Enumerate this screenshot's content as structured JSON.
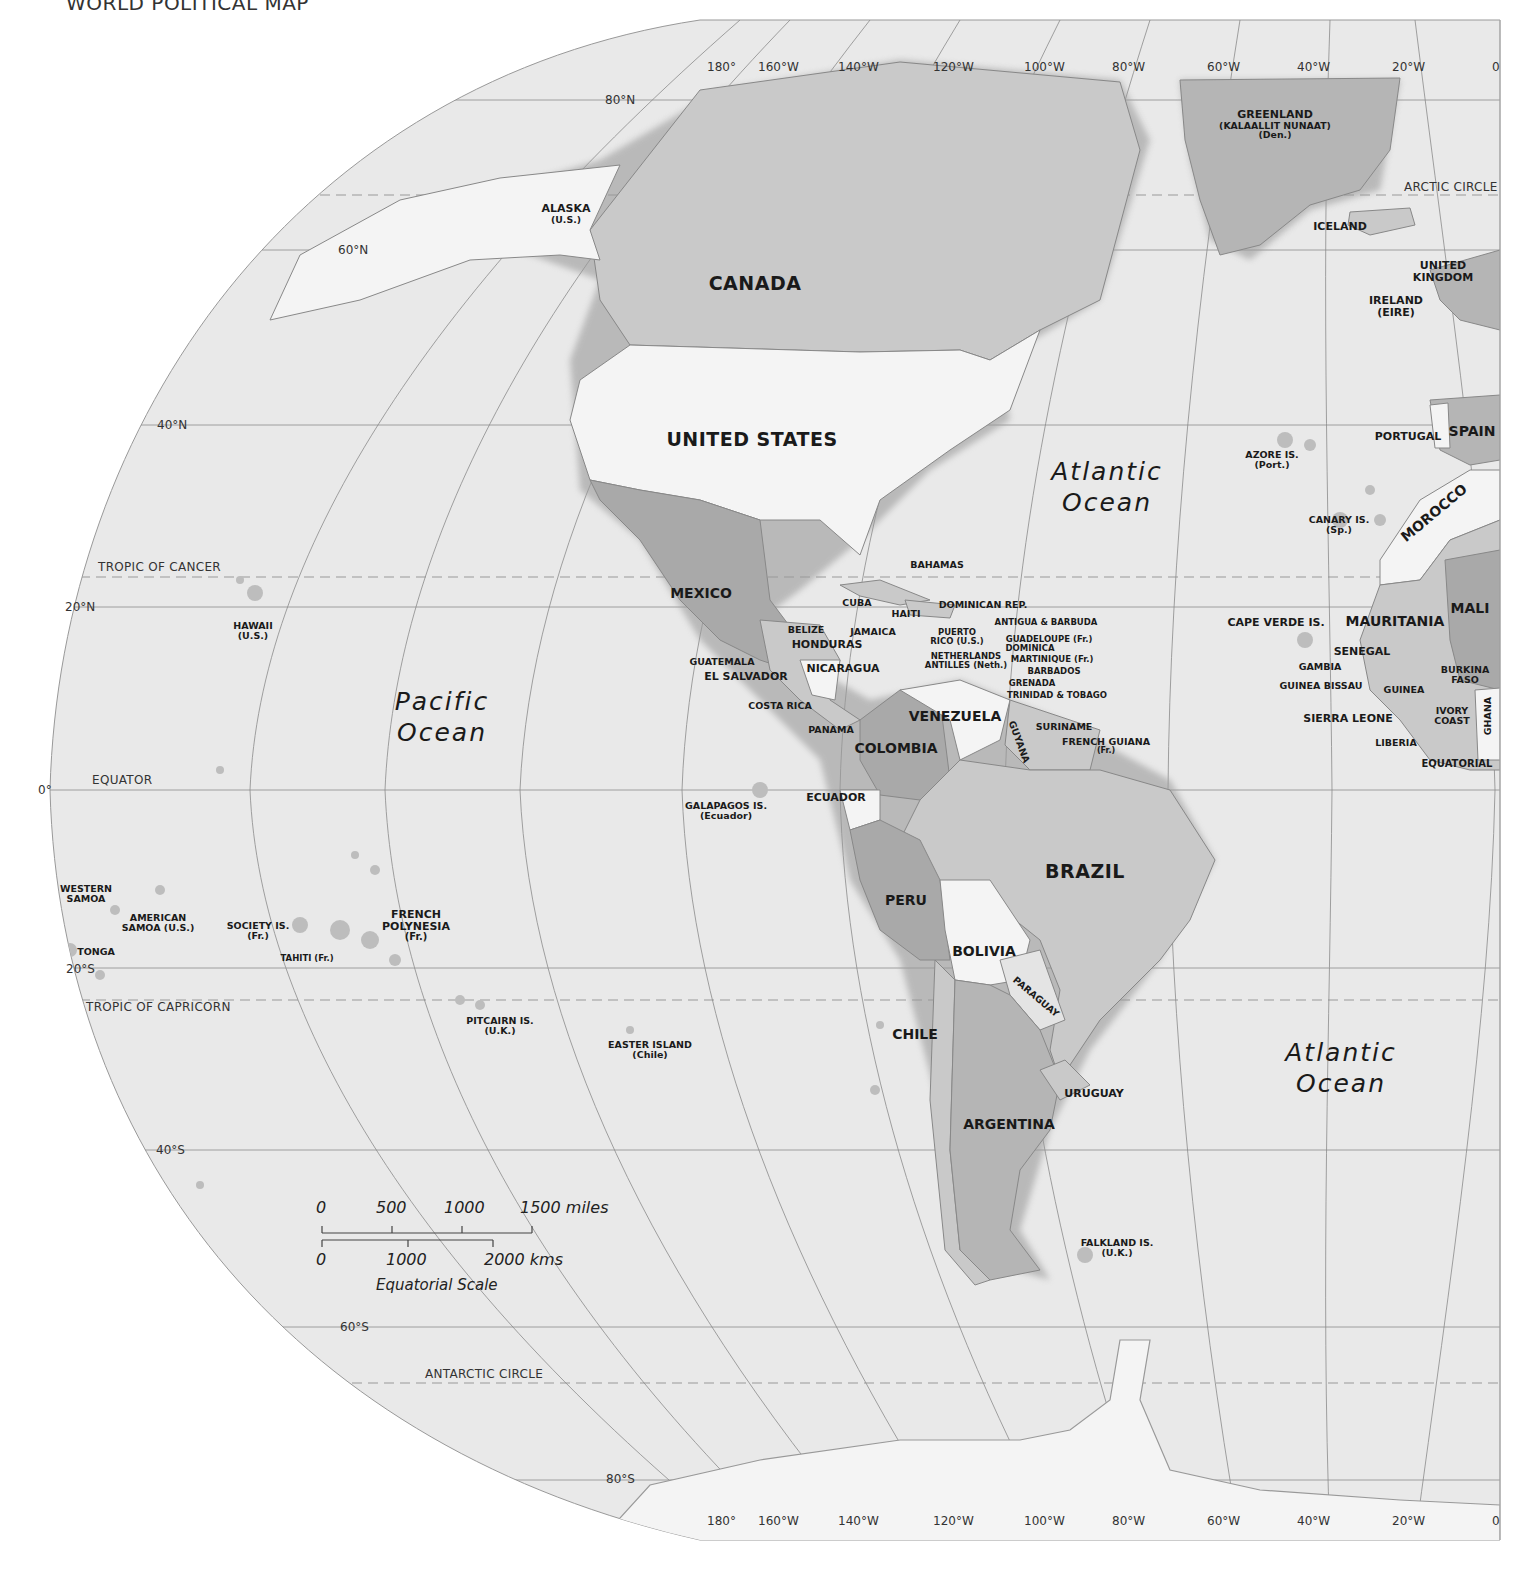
{
  "title": "WORLD POLITICAL MAP",
  "colors": {
    "ocean": "#e9e9e9",
    "land_light": "#f4f4f4",
    "land_mid": "#c9c9c9",
    "land_dark": "#a9a9a9",
    "coast_shadow": "#9a9a9a",
    "grid": "#8a8a8a",
    "text": "#1a1a1a"
  },
  "longitude_labels_top": [
    "180°",
    "160°W",
    "140°W",
    "120°W",
    "100°W",
    "80°W",
    "60°W",
    "40°W",
    "20°W",
    "0"
  ],
  "longitude_labels_bottom": [
    "180°",
    "160°W",
    "140°W",
    "120°W",
    "100°W",
    "80°W",
    "60°W",
    "40°W",
    "20°W",
    "0"
  ],
  "latitude_labels": {
    "n80": "80°N",
    "n60": "60°N",
    "n40": "40°N",
    "n20": "20°N",
    "eq": "0°",
    "s20": "20°S",
    "s40": "40°S",
    "s60": "60°S",
    "s80": "80°S"
  },
  "special_lines": {
    "arctic": "ARCTIC CIRCLE",
    "cancer": "TROPIC OF CANCER",
    "equator": "EQUATOR",
    "capricorn": "TROPIC OF CAPRICORN",
    "antarctic": "ANTARCTIC CIRCLE",
    "equatorial_africa": "EQUATORIAL"
  },
  "oceans": {
    "pacific": {
      "line1": "Pacific",
      "line2": "Ocean"
    },
    "atlantic_north": {
      "line1": "Atlantic",
      "line2": "Ocean"
    },
    "atlantic_south": {
      "line1": "Atlantic",
      "line2": "Ocean"
    }
  },
  "countries": {
    "canada": "CANADA",
    "united_states": "UNITED STATES",
    "alaska": {
      "name": "ALASKA",
      "note": "(U.S.)"
    },
    "greenland": {
      "name": "GREENLAND",
      "alt": "(KALAALLIT NUNAAT)",
      "note": "(Den.)"
    },
    "iceland": "ICELAND",
    "uk": {
      "line1": "UNITED",
      "line2": "KINGDOM"
    },
    "ireland": {
      "name": "IRELAND",
      "note": "(EIRE)"
    },
    "portugal": "PORTUGAL",
    "spain": "SPAIN",
    "morocco": "MOROCCO",
    "mauritania": "MAURITANIA",
    "mali": "MALI",
    "senegal": "SENEGAL",
    "gambia": "GAMBIA",
    "guinea_bissau": "GUINEA BISSAU",
    "guinea": "GUINEA",
    "burkina_faso": {
      "line1": "BURKINA",
      "line2": "FASO"
    },
    "ivory_coast": {
      "line1": "IVORY",
      "line2": "COAST"
    },
    "ghana": "GHANA",
    "sierra_leone": "SIERRA LEONE",
    "liberia": "LIBERIA",
    "mexico": "MEXICO",
    "cuba": "CUBA",
    "bahamas": "BAHAMAS",
    "haiti": "HAITI",
    "dominican_rep": "DOMINICAN REP.",
    "jamaica": "JAMAICA",
    "belize": "BELIZE",
    "honduras": "HONDURAS",
    "guatemala": "GUATEMALA",
    "el_salvador": "EL SALVADOR",
    "nicaragua": "NICARAGUA",
    "costa_rica": "COSTA RICA",
    "panama": "PANAMA",
    "puerto_rico": {
      "line1": "PUERTO",
      "line2": "RICO (U.S.)"
    },
    "antigua": "ANTIGUA & BARBUDA",
    "guadeloupe": "GUADELOUPE (Fr.)",
    "dominica": "DOMINICA",
    "martinique": "MARTINIQUE (Fr.)",
    "barbados": "BARBADOS",
    "netherlands_antilles": {
      "line1": "NETHERLANDS",
      "line2": "ANTILLES (Neth.)"
    },
    "grenada": "GRENADA",
    "trinidad": "TRINIDAD & TOBAGO",
    "venezuela": "VENEZUELA",
    "guyana": "GUYANA",
    "suriname": "SURINAME",
    "french_guiana": {
      "name": "FRENCH GUIANA",
      "note": "(Fr.)"
    },
    "colombia": "COLOMBIA",
    "ecuador": "ECUADOR",
    "peru": "PERU",
    "brazil": "BRAZIL",
    "bolivia": "BOLIVIA",
    "paraguay": "PARAGUAY",
    "chile": "CHILE",
    "argentina": "ARGENTINA",
    "uruguay": "URUGUAY"
  },
  "islands": {
    "hawaii": {
      "name": "HAWAII",
      "note": "(U.S.)"
    },
    "western_samoa": {
      "line1": "WESTERN",
      "line2": "SAMOA"
    },
    "american_samoa": {
      "line1": "AMERICAN",
      "line2": "SAMOA (U.S.)"
    },
    "tonga": "TONGA",
    "society": {
      "name": "SOCIETY IS.",
      "note": "(Fr.)"
    },
    "tahiti": "TAHITI (Fr.)",
    "french_polynesia": {
      "line1": "FRENCH",
      "line2": "POLYNESIA",
      "note": "(Fr.)"
    },
    "pitcairn": {
      "name": "PITCAIRN IS.",
      "note": "(U.K.)"
    },
    "easter": {
      "name": "EASTER ISLAND",
      "note": "(Chile)"
    },
    "galapagos": {
      "name": "GALAPAGOS IS.",
      "note": "(Ecuador)"
    },
    "falkland": {
      "name": "FALKLAND IS.",
      "note": "(U.K.)"
    },
    "azores": {
      "name": "AZORE IS.",
      "note": "(Port.)"
    },
    "canary": {
      "name": "CANARY IS.",
      "note": "(Sp.)"
    },
    "cape_verde": "CAPE VERDE IS."
  },
  "scale": {
    "miles_ticks": [
      "0",
      "500",
      "1000",
      "1500 miles"
    ],
    "km_ticks": [
      "0",
      "1000",
      "2000 kms"
    ],
    "caption": "Equatorial Scale"
  }
}
